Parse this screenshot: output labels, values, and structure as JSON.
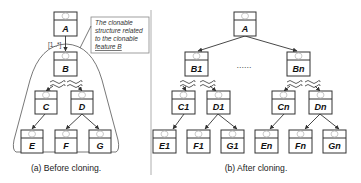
{
  "diagram": {
    "left_panel": {
      "caption": "(a) Before cloning.",
      "multiplicity": "[1..*]",
      "note": {
        "lines": [
          "The clonable",
          "structure related",
          "to the clonable",
          "feature B"
        ]
      },
      "nodes": {
        "A": "A",
        "B": "B",
        "C": "C",
        "D": "D",
        "E": "E",
        "F": "F",
        "G": "G"
      }
    },
    "right_panel": {
      "caption": "(b) After cloning.",
      "ellipsis": "......",
      "nodes": {
        "A": "A",
        "B1": "B1",
        "Bn": "Bn",
        "C1": "C1",
        "D1": "D1",
        "Cn": "Cn",
        "Dn": "Dn",
        "E1": "E1",
        "F1": "F1",
        "G1": "G1",
        "En": "En",
        "Fn": "Fn",
        "Gn": "Gn"
      }
    },
    "edges_left": [
      [
        "A",
        "B"
      ],
      [
        "B",
        "C",
        "wavy"
      ],
      [
        "B",
        "D",
        "wavy"
      ],
      [
        "C",
        "E"
      ],
      [
        "D",
        "F"
      ],
      [
        "D",
        "G"
      ]
    ],
    "edges_right": [
      [
        "A",
        "B1"
      ],
      [
        "A",
        "Bn"
      ],
      [
        "B1",
        "C1",
        "wavy"
      ],
      [
        "B1",
        "D1",
        "wavy"
      ],
      [
        "Bn",
        "Cn",
        "wavy"
      ],
      [
        "Bn",
        "Dn",
        "wavy"
      ],
      [
        "C1",
        "E1"
      ],
      [
        "D1",
        "F1"
      ],
      [
        "D1",
        "G1"
      ],
      [
        "Cn",
        "En"
      ],
      [
        "Dn",
        "Fn"
      ],
      [
        "Dn",
        "Gn"
      ]
    ]
  }
}
